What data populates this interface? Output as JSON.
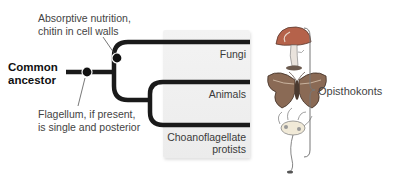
{
  "diagram": {
    "root": {
      "label_line1": "Common",
      "label_line2": "ancestor"
    },
    "annotations": {
      "fungi_trait": {
        "line1": "Absorptive nutrition,",
        "line2": "chitin in cell walls"
      },
      "opisthokont_trait": {
        "line1": "Flagellum, if present,",
        "line2": "is single and posterior"
      }
    },
    "taxa": [
      {
        "name": "Fungi",
        "illustration": "mushroom-illustration"
      },
      {
        "name": "Animals",
        "illustration": "moth-illustration"
      },
      {
        "name_line1": "Choanoflagellate",
        "name_line2": "protists",
        "illustration": "choanoflagellate-illustration"
      }
    ],
    "group": {
      "label": "Opisthokonts"
    },
    "colors": {
      "branch": "#1a1a1a",
      "shade": "#eeeeee",
      "mushroom_cap": "#b5624a",
      "moth_wing": "#8a6a55"
    }
  }
}
